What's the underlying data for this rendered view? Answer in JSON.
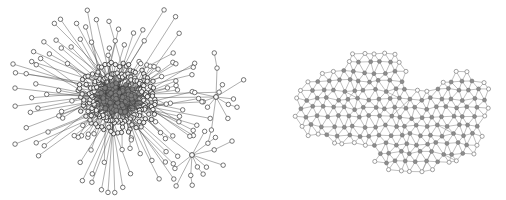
{
  "figure": {
    "title": "",
    "background_color": "#ffffff",
    "width": 506,
    "height": 200,
    "panel_count": 2
  },
  "panels": [
    {
      "id": "left",
      "name": "scale-free-hub-network",
      "caption": "",
      "topology": "scale-free / star-hub",
      "center": {
        "x": 118,
        "y": 98
      },
      "core_radius": 17,
      "node_count_estimate": 330,
      "edge_count_estimate": 360,
      "colors": {
        "edge": "#4a4a4a",
        "core_edge": "#262626",
        "leaf_fill": "#ffffff",
        "leaf_stroke": "#3d3d3d",
        "core_fill": "#7d7d7d"
      },
      "secondary_hubs": [
        {
          "x": 216,
          "y": 97,
          "spokes": 10
        },
        {
          "x": 192,
          "y": 155,
          "spokes": 9
        }
      ]
    },
    {
      "id": "right",
      "name": "planar-mesh-network",
      "caption": "",
      "topology": "dense planar mesh / lattice",
      "bounds": {
        "x0": 285,
        "y0": 40,
        "x1": 500,
        "y1": 186
      },
      "node_count_estimate": 250,
      "edge_count_estimate": 700,
      "colors": {
        "edge": "#8a8a8a",
        "interior_fill": "#8d8d8d",
        "boundary_fill": "#ffffff",
        "boundary_stroke": "#7a7a7a"
      }
    }
  ],
  "chart_data": {
    "type": "scatter",
    "title": "",
    "subtitle": "",
    "xlabel": "",
    "ylabel": "",
    "legend": [],
    "grid": false,
    "series": [
      {
        "name": "scale-free-hub-network",
        "degree_distribution": "heavy-tailed (power law)",
        "nodes": 330,
        "edges": 360,
        "hubs": 3,
        "mean_degree": 2.2
      },
      {
        "name": "planar-mesh-network",
        "degree_distribution": "narrow / near-uniform",
        "nodes": 250,
        "edges": 700,
        "hubs": 0,
        "mean_degree": 5.6
      }
    ]
  }
}
